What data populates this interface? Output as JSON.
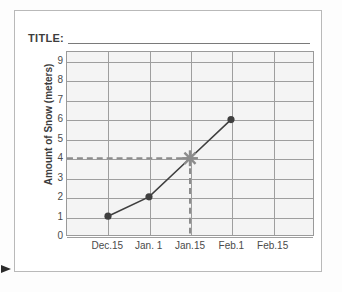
{
  "worksheet": {
    "title_label": "TITLE:",
    "title_value": "",
    "pointer_icon": "right-arrow-icon"
  },
  "chart_data": {
    "type": "line",
    "title": "",
    "xlabel": "",
    "ylabel": "Amount of Snow (meters)",
    "categories": [
      "Dec.15",
      "Jan. 1",
      "Jan.15",
      "Feb.1",
      "Feb.15"
    ],
    "x_tick_labels": [
      "Dec.15",
      "Jan. 1",
      "Jan.15",
      "Feb.1",
      "Feb.15"
    ],
    "y_tick_labels": [
      "9",
      "8",
      "7",
      "6",
      "5",
      "4",
      "3",
      "2",
      "1",
      "0"
    ],
    "ylim": [
      0,
      9.5
    ],
    "y_major_step": 1,
    "grid": true,
    "legend": "none",
    "series": [
      {
        "name": "Amount of Snow",
        "marker": "circle",
        "points": [
          {
            "x": "Dec.15",
            "y": 1
          },
          {
            "x": "Jan. 1",
            "y": 2
          },
          {
            "x": "Feb.1",
            "y": 6
          }
        ]
      }
    ],
    "highlight": {
      "label": "Jan.15",
      "x": "Jan.15",
      "y": 4,
      "marker": "star",
      "guide_style": "dashed",
      "guide_color": "#8c8c8c"
    },
    "colors": {
      "line": "#3f3f3f",
      "marker": "#3f3f3f",
      "grid": "#9e9e9e",
      "plot_background": "#f4f4f4",
      "highlight": "#8c8c8c",
      "text": "#4a4a4a",
      "border": "#b9b9b9"
    }
  }
}
